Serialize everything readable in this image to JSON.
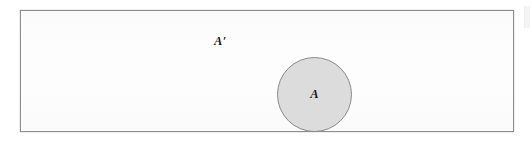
{
  "figure": {
    "kind": "venn-diagram",
    "universe": {
      "name": "universal-set-rectangle",
      "fill_color": "#fdfdfd",
      "border_color": "#8e8e8e"
    },
    "complement": {
      "label": "A′",
      "region_name": "complement-region"
    },
    "set_a": {
      "label": "A",
      "fill_color": "#dcdcdc",
      "border_color": "#8a8a8a"
    },
    "background_color": "#ffffff"
  }
}
